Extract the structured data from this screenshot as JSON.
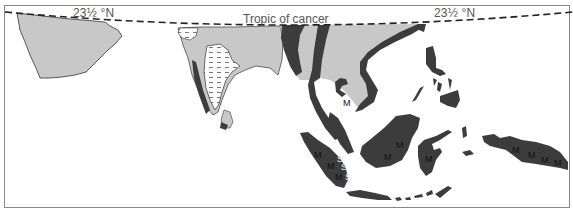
{
  "map": {
    "labels": {
      "lat_left": "23½ °N",
      "lat_right": "23½ °N",
      "tropic": "Tropic of cancer"
    },
    "colors": {
      "light_region": "#c8c8c8",
      "dark_region": "#3c3c3c",
      "hatched_region": "#ffffff",
      "tropic_line": "#222222",
      "outline": "#333333"
    },
    "legend_types": [
      "light-grey",
      "dark-grey",
      "dashed-hatch"
    ],
    "markers": {
      "M": "M",
      "S": "S"
    },
    "m_markers": [
      {
        "id": "thailand",
        "x": 343,
        "y": 98
      },
      {
        "id": "sumatra-1",
        "x": 314,
        "y": 150
      },
      {
        "id": "sumatra-2",
        "x": 327,
        "y": 161
      },
      {
        "id": "sumatra-3",
        "x": 335,
        "y": 172
      },
      {
        "id": "borneo-1",
        "x": 396,
        "y": 140
      },
      {
        "id": "borneo-2",
        "x": 384,
        "y": 152
      },
      {
        "id": "sulawesi",
        "x": 425,
        "y": 154
      },
      {
        "id": "newguinea-1",
        "x": 512,
        "y": 145
      },
      {
        "id": "newguinea-2",
        "x": 528,
        "y": 150
      },
      {
        "id": "newguinea-3",
        "x": 541,
        "y": 155
      },
      {
        "id": "newguinea-4",
        "x": 554,
        "y": 158
      }
    ],
    "s_markers": [
      {
        "id": "s1",
        "x": 337,
        "y": 154
      },
      {
        "id": "s2",
        "x": 341,
        "y": 162
      },
      {
        "id": "s3",
        "x": 345,
        "y": 172
      },
      {
        "id": "s4",
        "x": 346,
        "y": 180
      }
    ]
  }
}
